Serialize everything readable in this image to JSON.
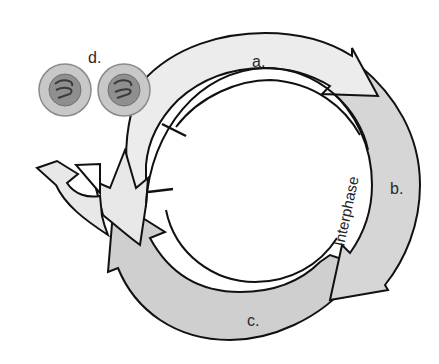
{
  "diagram": {
    "labels": {
      "a": "a.",
      "b": "b.",
      "c": "c.",
      "d": "d.",
      "interphase": "Interphase"
    },
    "colors": {
      "arrow_a": "#ececec",
      "arrow_b": "#d6d6d6",
      "arrow_c": "#cfcfcf",
      "arrow_d": "#e8e8e8",
      "cell_outer": "#c8c8c8",
      "cell_nucleus": "#8f8f8f",
      "outline": "#111111"
    },
    "cells": [
      {
        "name": "daughter-cell-1"
      },
      {
        "name": "daughter-cell-2"
      }
    ],
    "checkpoints": 2
  }
}
